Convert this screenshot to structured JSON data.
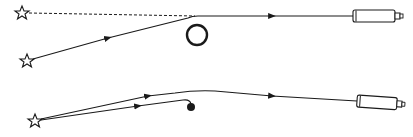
{
  "diagram": {
    "title": "",
    "colors": {
      "stroke": "#1a1a1a",
      "background": "#ffffff"
    },
    "panels": [
      {
        "id": "top",
        "elements": [
          {
            "type": "star",
            "role": "apparent-position",
            "x": 22,
            "y": 13
          },
          {
            "type": "dashed-line",
            "role": "apparent-path",
            "from": [
              26,
              13
            ],
            "to": [
              195,
              16
            ]
          },
          {
            "type": "star",
            "role": "true-position",
            "x": 27,
            "y": 61
          },
          {
            "type": "ray",
            "from": [
              31,
              60
            ],
            "to": [
              195,
              16
            ],
            "arrow_at": [
              108,
              38
            ]
          },
          {
            "type": "circle",
            "role": "massive-object",
            "cx": 197,
            "cy": 35,
            "r": 10
          },
          {
            "type": "ray",
            "from": [
              195,
              16
            ],
            "to": [
              353,
              16
            ],
            "arrow_at": [
              272,
              16
            ]
          },
          {
            "type": "telescope",
            "x": 353,
            "y": 16
          }
        ]
      },
      {
        "id": "bottom",
        "elements": [
          {
            "type": "star",
            "role": "source",
            "x": 35,
            "y": 121
          },
          {
            "type": "ray",
            "role": "upper-path",
            "from": [
              39,
              119
            ],
            "via": [
              210,
              91
            ],
            "to": [
              357,
              101
            ],
            "arrow_at": [
              [
                148,
                96
              ],
              [
                272,
                96
              ]
            ]
          },
          {
            "type": "ray",
            "role": "lower-path",
            "from": [
              39,
              120
            ],
            "via": [
              185,
              99
            ],
            "to": [
              191,
              104
            ],
            "arrow_at": [
              138,
              106
            ]
          },
          {
            "type": "dot",
            "role": "compact-object",
            "cx": 191,
            "cy": 107,
            "r": 4
          },
          {
            "type": "telescope",
            "x": 357,
            "y": 101,
            "tilt_deg": 4
          }
        ]
      }
    ]
  }
}
